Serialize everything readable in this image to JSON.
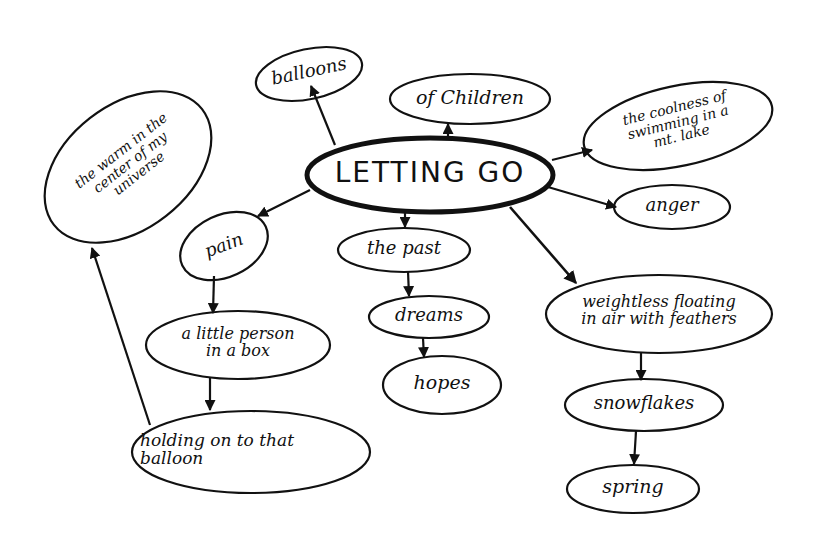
{
  "diagram": {
    "type": "concept-map",
    "central": {
      "label": "LETTING GO"
    },
    "nodes": [
      {
        "id": "balloons",
        "label": "balloons"
      },
      {
        "id": "children",
        "label": "of Children"
      },
      {
        "id": "coolness",
        "label": "the coolness of\nswimming in a\nmt. lake"
      },
      {
        "id": "warm",
        "label": "the warm in the\ncenter of my\nuniverse"
      },
      {
        "id": "anger",
        "label": "anger"
      },
      {
        "id": "pain",
        "label": "pain"
      },
      {
        "id": "past",
        "label": "the past"
      },
      {
        "id": "weightless",
        "label": "weightless floating\nin air with feathers"
      },
      {
        "id": "little",
        "label": "a little person\nin a box"
      },
      {
        "id": "dreams",
        "label": "dreams"
      },
      {
        "id": "hopes",
        "label": "hopes"
      },
      {
        "id": "snowflakes",
        "label": "snowflakes"
      },
      {
        "id": "holding",
        "label": "holding on to that\nballoon"
      },
      {
        "id": "spring",
        "label": "spring"
      }
    ],
    "edges": [
      [
        "LETTING GO",
        "balloons"
      ],
      [
        "LETTING GO",
        "of Children"
      ],
      [
        "LETTING GO",
        "the coolness of swimming in a mt. lake"
      ],
      [
        "LETTING GO",
        "anger"
      ],
      [
        "LETTING GO",
        "pain"
      ],
      [
        "LETTING GO",
        "the past"
      ],
      [
        "LETTING GO",
        "weightless floating in air with feathers"
      ],
      [
        "pain",
        "a little person in a box"
      ],
      [
        "a little person in a box",
        "holding on to that balloon"
      ],
      [
        "holding on to that balloon",
        "the warm in the center of my universe"
      ],
      [
        "the past",
        "dreams"
      ],
      [
        "dreams",
        "hopes"
      ],
      [
        "weightless floating in air with feathers",
        "snowflakes"
      ],
      [
        "snowflakes",
        "spring"
      ]
    ]
  }
}
